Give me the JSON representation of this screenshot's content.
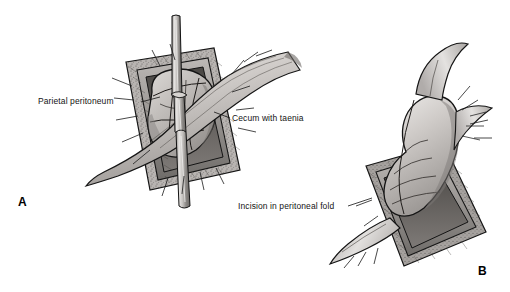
{
  "figure": {
    "background_color": "#ffffff",
    "style": "grayscale medical line illustration",
    "ink_color": "#141414"
  },
  "labels": [
    {
      "id": "parietal-peritoneum",
      "text": "Parietal peritoneum",
      "panel": "A"
    },
    {
      "id": "cecum-with-taenia",
      "text": "Cecum with taenia",
      "panel": "A"
    },
    {
      "id": "incision-in-peritoneal-fold",
      "text": "Incision in peritoneal fold",
      "panel": "B"
    }
  ],
  "panels": [
    {
      "id": "panel-a",
      "letter": "A",
      "description": "Cecum with taenia exposed through square abdominal wound retracted by parietal peritoneum edges, vertical clamp in place"
    },
    {
      "id": "panel-b",
      "letter": "B",
      "description": "Bowel delivered through wound, incision made in peritoneal fold"
    }
  ],
  "colors": {
    "tissue_light": "#d8d5d2",
    "tissue_mid": "#b3afac",
    "tissue_dark": "#8d8986",
    "tissue_deep": "#66625f",
    "outline": "#1a1a1a",
    "instrument_light": "#e6e4e2",
    "instrument_mid": "#a8a5a2",
    "fat_stipple": "#9b9794"
  }
}
